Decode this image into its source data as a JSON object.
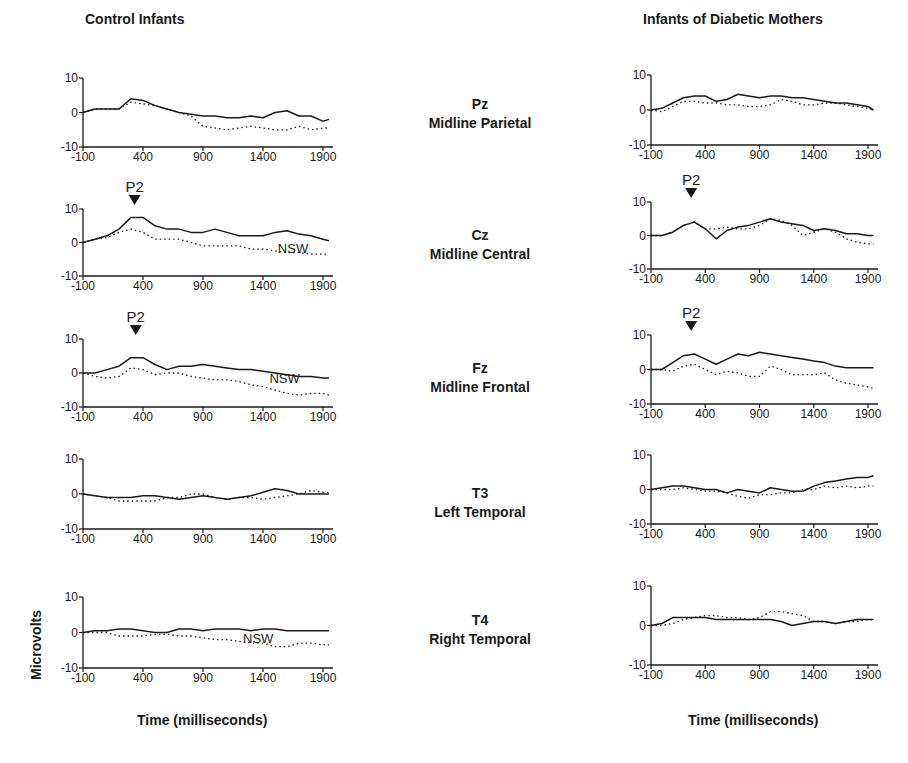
{
  "titles": {
    "left": "Control Infants",
    "right": "Infants of Diabetic Mothers"
  },
  "electrodes": [
    {
      "code": "Pz",
      "name": "Midline Parietal"
    },
    {
      "code": "Cz",
      "name": "Midline Central"
    },
    {
      "code": "Fz",
      "name": "Midline Frontal"
    },
    {
      "code": "T3",
      "name": "Left Temporal"
    },
    {
      "code": "T4",
      "name": "Right Temporal"
    }
  ],
  "axes": {
    "xlabel": "Time (milliseconds)",
    "ylabel": "Microvolts",
    "xticks": [
      -100,
      400,
      900,
      1400,
      1900
    ],
    "yticks": [
      10,
      0,
      -10
    ]
  },
  "annotations": {
    "p2": "P2",
    "nsw": "NSW"
  },
  "colors": {
    "ink": "#1a1a1a",
    "background": "#ffffff"
  },
  "chart_data": [
    {
      "type": "line",
      "group": "Control Infants",
      "electrode": "Pz",
      "title": "Pz Midline Parietal",
      "xlabel": "Time (milliseconds)",
      "ylabel": "Microvolts",
      "xlim": [
        -100,
        2000
      ],
      "ylim": [
        -10,
        10
      ],
      "x": [
        -100,
        0,
        100,
        200,
        300,
        400,
        500,
        600,
        700,
        800,
        900,
        1000,
        1100,
        1200,
        1300,
        1400,
        1500,
        1600,
        1700,
        1800,
        1900,
        1950
      ],
      "series": [
        {
          "name": "solid",
          "style": "solid",
          "values": [
            0,
            1,
            1,
            1,
            4,
            3.5,
            2,
            1,
            0,
            -0.5,
            -1,
            -1,
            -1.5,
            -1.5,
            -1,
            -1.5,
            0,
            0.5,
            -1,
            -1,
            -2.5,
            -2
          ]
        },
        {
          "name": "dotted",
          "style": "dotted",
          "values": [
            0,
            1,
            1,
            1,
            3,
            2.5,
            2,
            1,
            0,
            -1,
            -4,
            -4.5,
            -5,
            -4.5,
            -4,
            -4.5,
            -5,
            -5,
            -4,
            -5,
            -4.5,
            -4.5
          ]
        }
      ],
      "annotations": []
    },
    {
      "type": "line",
      "group": "Control Infants",
      "electrode": "Cz",
      "title": "Cz Midline Central",
      "xlabel": "Time (milliseconds)",
      "ylabel": "Microvolts",
      "xlim": [
        -100,
        2000
      ],
      "ylim": [
        -10,
        10
      ],
      "x": [
        -100,
        0,
        100,
        200,
        300,
        400,
        500,
        600,
        700,
        800,
        900,
        1000,
        1100,
        1200,
        1300,
        1400,
        1500,
        1600,
        1700,
        1800,
        1900,
        1950
      ],
      "series": [
        {
          "name": "solid",
          "style": "solid",
          "values": [
            0,
            1,
            2,
            4,
            7.5,
            7.5,
            5,
            4,
            4,
            3,
            3,
            4,
            3,
            2,
            2,
            2,
            3,
            3.5,
            2.5,
            2,
            1,
            0.5
          ]
        },
        {
          "name": "dotted",
          "style": "dotted",
          "values": [
            0,
            1,
            1.5,
            3,
            4,
            3,
            1,
            1,
            1,
            0,
            -1,
            -1,
            -1,
            -1,
            -2,
            -2,
            -2.5,
            -3,
            -3,
            -3.5,
            -3.5,
            -3.5
          ]
        }
      ],
      "annotations": [
        {
          "text": "P2",
          "x": 330,
          "marker": "triangle-down"
        },
        {
          "text": "NSW",
          "x": 1650
        }
      ]
    },
    {
      "type": "line",
      "group": "Control Infants",
      "electrode": "Fz",
      "title": "Fz Midline Frontal",
      "xlabel": "Time (milliseconds)",
      "ylabel": "Microvolts",
      "xlim": [
        -100,
        2000
      ],
      "ylim": [
        -10,
        10
      ],
      "x": [
        -100,
        0,
        100,
        200,
        300,
        400,
        500,
        600,
        700,
        800,
        900,
        1000,
        1100,
        1200,
        1300,
        1400,
        1500,
        1600,
        1700,
        1800,
        1900,
        1950
      ],
      "series": [
        {
          "name": "solid",
          "style": "solid",
          "values": [
            0,
            0,
            1,
            2,
            4.5,
            4.5,
            2.5,
            1,
            2,
            2,
            2.5,
            2,
            1.5,
            1,
            1,
            0.5,
            0,
            -0.5,
            -1,
            -1,
            -1.5,
            -1.5
          ]
        },
        {
          "name": "dotted",
          "style": "dotted",
          "values": [
            0,
            -1,
            -1.5,
            -1,
            1.5,
            1,
            -0.5,
            0,
            0,
            -1,
            -1.5,
            -2,
            -2,
            -2.5,
            -3.5,
            -4,
            -5,
            -6,
            -6.5,
            -6,
            -6,
            -6.5
          ]
        }
      ],
      "annotations": [
        {
          "text": "P2",
          "x": 340,
          "marker": "triangle-down"
        },
        {
          "text": "NSW",
          "x": 1580
        }
      ]
    },
    {
      "type": "line",
      "group": "Control Infants",
      "electrode": "T3",
      "title": "T3 Left Temporal",
      "xlabel": "Time (milliseconds)",
      "ylabel": "Microvolts",
      "xlim": [
        -100,
        2000
      ],
      "ylim": [
        -10,
        10
      ],
      "x": [
        -100,
        0,
        100,
        200,
        300,
        400,
        500,
        600,
        700,
        800,
        900,
        1000,
        1100,
        1200,
        1300,
        1400,
        1500,
        1600,
        1700,
        1800,
        1900,
        1950
      ],
      "series": [
        {
          "name": "solid",
          "style": "solid",
          "values": [
            0,
            -0.5,
            -1,
            -1,
            -1,
            -0.5,
            -0.5,
            -1,
            -1.5,
            -1,
            -0.5,
            -1,
            -1.5,
            -1,
            -0.5,
            0.5,
            1.5,
            1,
            0,
            0,
            0,
            0
          ]
        },
        {
          "name": "dotted",
          "style": "dotted",
          "values": [
            0,
            -0.5,
            -1,
            -2,
            -2,
            -2,
            -2,
            -1,
            -1,
            0,
            0,
            -1,
            -1.5,
            -1,
            -1,
            -1.5,
            -1,
            -0.5,
            0,
            1,
            0.5,
            0.5
          ]
        }
      ],
      "annotations": []
    },
    {
      "type": "line",
      "group": "Control Infants",
      "electrode": "T4",
      "title": "T4 Right Temporal",
      "xlabel": "Time (milliseconds)",
      "ylabel": "Microvolts",
      "xlim": [
        -100,
        2000
      ],
      "ylim": [
        -10,
        10
      ],
      "x": [
        -100,
        0,
        100,
        200,
        300,
        400,
        500,
        600,
        700,
        800,
        900,
        1000,
        1100,
        1200,
        1300,
        1400,
        1500,
        1600,
        1700,
        1800,
        1900,
        1950
      ],
      "series": [
        {
          "name": "solid",
          "style": "solid",
          "values": [
            0,
            0.5,
            0.5,
            1,
            1,
            0.5,
            0,
            0,
            1,
            1,
            0.5,
            1,
            1,
            1,
            0.5,
            1,
            1,
            0.5,
            0.5,
            0.5,
            0.5,
            0.5
          ]
        },
        {
          "name": "dotted",
          "style": "dotted",
          "values": [
            0,
            0,
            0,
            -1,
            -1,
            -1,
            -0.5,
            -0.5,
            -1,
            -1,
            -1.5,
            -2,
            -2,
            -2.5,
            -3,
            -3,
            -4,
            -4,
            -3,
            -3,
            -3.5,
            -3.5
          ]
        }
      ],
      "annotations": [
        {
          "text": "NSW",
          "x": 1360
        }
      ]
    },
    {
      "type": "line",
      "group": "Infants of Diabetic Mothers",
      "electrode": "Pz",
      "title": "Pz Midline Parietal",
      "xlabel": "Time (milliseconds)",
      "ylabel": "Microvolts",
      "xlim": [
        -100,
        2000
      ],
      "ylim": [
        -10,
        10
      ],
      "x": [
        -100,
        0,
        100,
        200,
        300,
        400,
        500,
        600,
        700,
        800,
        900,
        1000,
        1100,
        1200,
        1300,
        1400,
        1500,
        1600,
        1700,
        1800,
        1900,
        1950
      ],
      "series": [
        {
          "name": "solid",
          "style": "solid",
          "values": [
            0,
            0.5,
            2,
            3.5,
            4,
            4,
            2.5,
            3,
            4.5,
            4,
            3.5,
            4,
            4,
            3.5,
            3.5,
            3,
            2.5,
            2,
            2,
            1.5,
            1,
            0
          ]
        },
        {
          "name": "dotted",
          "style": "dotted",
          "values": [
            0,
            -0.5,
            1,
            2.5,
            2.5,
            2,
            2,
            1.5,
            1.5,
            1,
            1,
            1.5,
            3,
            2.5,
            1.5,
            1.5,
            2,
            2,
            1.5,
            1,
            0.5,
            0
          ]
        }
      ],
      "annotations": []
    },
    {
      "type": "line",
      "group": "Infants of Diabetic Mothers",
      "electrode": "Cz",
      "title": "Cz Midline Central",
      "xlabel": "Time (milliseconds)",
      "ylabel": "Microvolts",
      "xlim": [
        -100,
        2000
      ],
      "ylim": [
        -10,
        10
      ],
      "x": [
        -100,
        0,
        100,
        200,
        300,
        400,
        500,
        600,
        700,
        800,
        900,
        1000,
        1100,
        1200,
        1300,
        1400,
        1500,
        1600,
        1700,
        1800,
        1900,
        1950
      ],
      "series": [
        {
          "name": "solid",
          "style": "solid",
          "values": [
            0,
            0,
            1,
            3,
            4,
            2,
            -1,
            1.5,
            2.5,
            3,
            4,
            5,
            4,
            3.5,
            3,
            1.5,
            2,
            1.5,
            0.5,
            0.5,
            0,
            0
          ]
        },
        {
          "name": "dotted",
          "style": "dotted",
          "values": [
            0,
            0,
            1,
            3,
            4,
            2,
            2,
            2.5,
            2,
            2,
            3,
            5,
            4.5,
            3,
            0,
            1,
            2,
            1,
            -1,
            -2,
            -2.5,
            -2.5
          ]
        }
      ],
      "annotations": [
        {
          "text": "P2",
          "x": 270,
          "marker": "triangle-down"
        }
      ]
    },
    {
      "type": "line",
      "group": "Infants of Diabetic Mothers",
      "electrode": "Fz",
      "title": "Fz Midline Frontal",
      "xlabel": "Time (milliseconds)",
      "ylabel": "Microvolts",
      "xlim": [
        -100,
        2000
      ],
      "ylim": [
        -10,
        10
      ],
      "x": [
        -100,
        0,
        100,
        200,
        300,
        400,
        500,
        600,
        700,
        800,
        900,
        1000,
        1100,
        1200,
        1300,
        1400,
        1500,
        1600,
        1700,
        1800,
        1900,
        1950
      ],
      "series": [
        {
          "name": "solid",
          "style": "solid",
          "values": [
            0,
            0,
            2,
            4,
            4.5,
            3,
            1.5,
            3,
            4.5,
            4,
            5,
            4.5,
            4,
            3.5,
            3,
            2.5,
            2,
            1,
            0.5,
            0.5,
            0.5,
            0.5
          ]
        },
        {
          "name": "dotted",
          "style": "dotted",
          "values": [
            0,
            0,
            -0.5,
            1,
            1.5,
            0,
            -1.5,
            -0.5,
            -1,
            -2,
            -2,
            1,
            0,
            -1.5,
            -1.5,
            -1.5,
            -1,
            -3,
            -4,
            -4.5,
            -5,
            -5.5
          ]
        }
      ],
      "annotations": [
        {
          "text": "P2",
          "x": 270,
          "marker": "triangle-down"
        }
      ]
    },
    {
      "type": "line",
      "group": "Infants of Diabetic Mothers",
      "electrode": "T3",
      "title": "T3 Left Temporal",
      "xlabel": "Time (milliseconds)",
      "ylabel": "Microvolts",
      "xlim": [
        -100,
        2000
      ],
      "ylim": [
        -10,
        10
      ],
      "x": [
        -100,
        0,
        100,
        200,
        300,
        400,
        500,
        600,
        700,
        800,
        900,
        1000,
        1100,
        1200,
        1300,
        1400,
        1500,
        1600,
        1700,
        1800,
        1900,
        1950
      ],
      "series": [
        {
          "name": "solid",
          "style": "solid",
          "values": [
            0,
            0.5,
            1,
            1,
            0.5,
            0,
            0,
            -1,
            0,
            -0.5,
            -1,
            0.5,
            0,
            -0.5,
            -0.5,
            1,
            2,
            2.5,
            3,
            3.5,
            3.5,
            4
          ]
        },
        {
          "name": "dotted",
          "style": "dotted",
          "values": [
            0,
            0,
            0,
            0.5,
            0,
            -0.5,
            -0.5,
            -1,
            -2,
            -2.5,
            -1.5,
            -1.5,
            -1,
            -1,
            0,
            0,
            1,
            0.5,
            1,
            0.5,
            1,
            1
          ]
        }
      ],
      "annotations": []
    },
    {
      "type": "line",
      "group": "Infants of Diabetic Mothers",
      "electrode": "T4",
      "title": "T4 Right Temporal",
      "xlabel": "Time (milliseconds)",
      "ylabel": "Microvolts",
      "xlim": [
        -100,
        2000
      ],
      "ylim": [
        -10,
        10
      ],
      "x": [
        -100,
        0,
        100,
        200,
        300,
        400,
        500,
        600,
        700,
        800,
        900,
        1000,
        1100,
        1200,
        1300,
        1400,
        1500,
        1600,
        1700,
        1800,
        1900,
        1950
      ],
      "series": [
        {
          "name": "solid",
          "style": "solid",
          "values": [
            0,
            0.5,
            2,
            2,
            2,
            2,
            1.5,
            1.5,
            1.5,
            1.5,
            1.5,
            1.5,
            1,
            0,
            0.5,
            1,
            1,
            0.5,
            1,
            1.5,
            1.5,
            1.5
          ]
        },
        {
          "name": "dotted",
          "style": "dotted",
          "values": [
            0,
            0,
            0.5,
            1.5,
            2,
            2.5,
            2.5,
            2,
            2,
            1.5,
            2,
            3.5,
            3.5,
            3,
            2.5,
            1,
            1,
            0.5,
            1,
            1,
            1.5,
            1.5
          ]
        }
      ],
      "annotations": []
    }
  ]
}
